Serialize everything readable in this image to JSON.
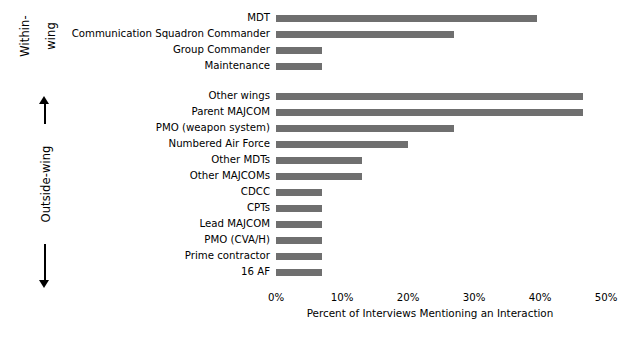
{
  "chart_data": {
    "type": "bar",
    "orientation": "horizontal",
    "title": "",
    "xlabel": "Percent of Interviews Mentioning an Interaction",
    "ylabel": "",
    "xlim": [
      0,
      50
    ],
    "xticks": [
      "0%",
      "10%",
      "20%",
      "30%",
      "40%",
      "50%"
    ],
    "xtick_values": [
      0,
      10,
      20,
      30,
      40,
      50
    ],
    "grid": false,
    "legend": null,
    "bar_color": "#6f6f6f",
    "groups": [
      {
        "name": "Within-wing",
        "axis_label_lines": [
          "Within-",
          "wing"
        ],
        "categories": [
          "MDT",
          "Communication Squadron Commander",
          "Group Commander",
          "Maintenance"
        ],
        "values": [
          39.5,
          27.0,
          7.0,
          7.0
        ]
      },
      {
        "name": "Outside-wing",
        "axis_label_lines": [
          "Outside-wing"
        ],
        "categories": [
          "Other wings",
          "Parent MAJCOM",
          "PMO (weapon system)",
          "Numbered Air Force",
          "Other MDTs",
          "Other MAJCOMs",
          "CDCC",
          "CPTs",
          "Lead MAJCOM",
          "PMO (CVA/H)",
          "Prime contractor",
          "16 AF"
        ],
        "values": [
          46.5,
          46.5,
          27.0,
          20.0,
          13.0,
          13.0,
          7.0,
          7.0,
          7.0,
          7.0,
          7.0,
          7.0
        ]
      }
    ],
    "categories": [
      "MDT",
      "Communication Squadron Commander",
      "Group Commander",
      "Maintenance",
      "Other wings",
      "Parent MAJCOM",
      "PMO (weapon system)",
      "Numbered Air Force",
      "Other MDTs",
      "Other MAJCOMs",
      "CDCC",
      "CPTs",
      "Lead MAJCOM",
      "PMO (CVA/H)",
      "Prime contractor",
      "16 AF"
    ],
    "values": [
      39.5,
      27.0,
      7.0,
      7.0,
      46.5,
      46.5,
      27.0,
      20.0,
      13.0,
      13.0,
      7.0,
      7.0,
      7.0,
      7.0,
      7.0,
      7.0
    ]
  }
}
